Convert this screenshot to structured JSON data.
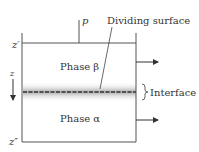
{
  "diagram": {
    "type": "two-phase system with interface",
    "labels": {
      "pressure": "p",
      "dividing_surface": "Dividing surface",
      "phase_top": "Phase β",
      "phase_bottom": "Phase α",
      "interface": "Interface",
      "z_axis": "z",
      "z_top": "z′",
      "z_bottom": "z″"
    },
    "colors": {
      "line": "#555555",
      "text": "#333333",
      "interface_dash": "#333333",
      "interface_band": "#bbbbbb",
      "background": "#ffffff"
    }
  }
}
